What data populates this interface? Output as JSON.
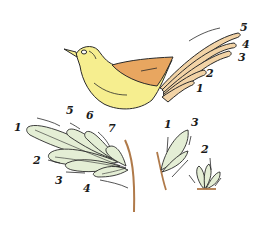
{
  "figure": {
    "colors": {
      "bird_body": "#f6ee8f",
      "bird_wing": "#e8a660",
      "tail": "#f2d3a6",
      "leaf": "#e4eed5",
      "stem": "#b07a4a",
      "outline": "#2a2a2a"
    }
  },
  "bird": {
    "tail_labels": [
      "1",
      "2",
      "3",
      "4",
      "5"
    ]
  },
  "branch": {
    "leaf_labels": [
      "1",
      "2",
      "3",
      "4",
      "5",
      "6",
      "7"
    ]
  },
  "sprig_left": {
    "labels": [
      "1",
      "3"
    ]
  },
  "sprig_right": {
    "labels": [
      "2"
    ]
  }
}
